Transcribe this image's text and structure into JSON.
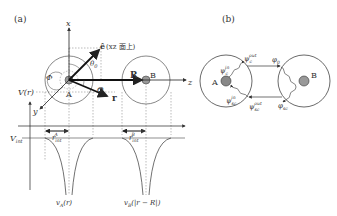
{
  "panel_a": {
    "label": "(a)",
    "axis_x": "x",
    "axis_z": "z",
    "axis_y": "y",
    "e_vector": "ê",
    "e_note": "(xz 面上)",
    "theta0": "θ",
    "theta0_sub": "0",
    "phi": "Φ",
    "Theta": "Θ",
    "R_vec": "R",
    "r_vec": "r",
    "atom_a": "A",
    "atom_b": "B",
    "V_r": "V(r)",
    "V_int": "V",
    "V_int_sub": "int",
    "r_int_a": "r",
    "r_int_a_sub": "int",
    "r_int_a_sup": "A",
    "r_int_b": "r",
    "r_int_b_sub": "int",
    "r_int_b_sup": "B",
    "v_a": "v",
    "v_a_sub": "A",
    "v_a_arg": "(r)",
    "v_b": "v",
    "v_b_sub": "B",
    "v_b_arg": "(|r − R|)"
  },
  "panel_b": {
    "label": "(b)",
    "atom_a": "A",
    "atom_b": "B",
    "psi_c_in": "ψ",
    "psi_c_in_sub": "c",
    "psi_c_in_sup": "in",
    "psi_c_out": "ψ",
    "psi_c_out_sub": "c",
    "psi_c_out_sup": "out",
    "psi_sc_in": "ψ",
    "psi_sc_in_sub": "sc",
    "psi_sc_in_sup": "in",
    "psi_sc_out": "ψ",
    "psi_sc_out_sub": "sc",
    "psi_sc_out_sup": "out",
    "phi_0": "φ",
    "phi_0_sub": "0",
    "phi_sc": "φ",
    "phi_sc_sub": "sc"
  }
}
